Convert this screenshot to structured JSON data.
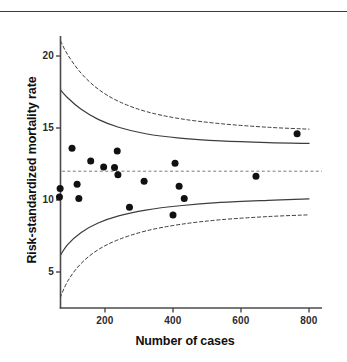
{
  "figure": {
    "top_rule": "horizontal-rule",
    "background_color": "#ffffff",
    "axis_color": "#4a4a4a",
    "point_color": "#111111",
    "line_color": "#3d3d3d"
  },
  "chart_data": {
    "type": "scatter",
    "title": "",
    "subtitle": "",
    "xlabel": "Number of cases",
    "ylabel": "Risk-standardized mortality rate",
    "xlim": [
      60,
      800
    ],
    "ylim": [
      2.8,
      21.5
    ],
    "xticks": [
      200,
      400,
      600,
      800
    ],
    "xtick_labels": [
      "200",
      "400",
      "600",
      "800"
    ],
    "yticks": [
      5,
      10,
      15,
      20
    ],
    "ytick_labels": [
      "5",
      "10",
      "15",
      "20"
    ],
    "grid": false,
    "legend": null,
    "legend_position": "none",
    "annotations": [],
    "target_line": {
      "label": "overall mean",
      "value": 12.0,
      "style": "dashed"
    },
    "series": [
      {
        "name": "Hospitals",
        "type": "scatter",
        "marker": "filled-circle",
        "points": [
          {
            "x": 68,
            "y": 10.8
          },
          {
            "x": 66,
            "y": 10.2
          },
          {
            "x": 103,
            "y": 13.6
          },
          {
            "x": 118,
            "y": 11.1
          },
          {
            "x": 123,
            "y": 10.1
          },
          {
            "x": 158,
            "y": 12.7
          },
          {
            "x": 196,
            "y": 12.3
          },
          {
            "x": 228,
            "y": 12.25
          },
          {
            "x": 236,
            "y": 13.4
          },
          {
            "x": 238,
            "y": 11.75
          },
          {
            "x": 272,
            "y": 9.5
          },
          {
            "x": 315,
            "y": 11.3
          },
          {
            "x": 400,
            "y": 8.95
          },
          {
            "x": 406,
            "y": 12.55
          },
          {
            "x": 418,
            "y": 10.95
          },
          {
            "x": 433,
            "y": 10.1
          },
          {
            "x": 644,
            "y": 11.65
          },
          {
            "x": 765,
            "y": 14.6
          }
        ]
      },
      {
        "name": "95% control limit (upper)",
        "type": "line",
        "style": "solid",
        "points": [
          {
            "x": 62,
            "y": 17.85
          },
          {
            "x": 90,
            "y": 17.1
          },
          {
            "x": 130,
            "y": 16.3
          },
          {
            "x": 180,
            "y": 15.6
          },
          {
            "x": 240,
            "y": 15.05
          },
          {
            "x": 320,
            "y": 14.6
          },
          {
            "x": 420,
            "y": 14.3
          },
          {
            "x": 540,
            "y": 14.1
          },
          {
            "x": 680,
            "y": 13.98
          },
          {
            "x": 800,
            "y": 13.93
          }
        ]
      },
      {
        "name": "95% control limit (lower)",
        "type": "line",
        "style": "solid",
        "points": [
          {
            "x": 62,
            "y": 5.9
          },
          {
            "x": 90,
            "y": 6.9
          },
          {
            "x": 130,
            "y": 7.75
          },
          {
            "x": 180,
            "y": 8.4
          },
          {
            "x": 240,
            "y": 8.9
          },
          {
            "x": 320,
            "y": 9.3
          },
          {
            "x": 420,
            "y": 9.6
          },
          {
            "x": 540,
            "y": 9.83
          },
          {
            "x": 680,
            "y": 9.98
          },
          {
            "x": 800,
            "y": 10.08
          }
        ]
      },
      {
        "name": "99.8% control limit (upper)",
        "type": "line",
        "style": "dashed",
        "points": [
          {
            "x": 62,
            "y": 21.4
          },
          {
            "x": 90,
            "y": 20.1
          },
          {
            "x": 130,
            "y": 18.8
          },
          {
            "x": 180,
            "y": 17.7
          },
          {
            "x": 240,
            "y": 16.85
          },
          {
            "x": 320,
            "y": 16.15
          },
          {
            "x": 420,
            "y": 15.65
          },
          {
            "x": 540,
            "y": 15.3
          },
          {
            "x": 680,
            "y": 15.05
          },
          {
            "x": 800,
            "y": 14.92
          }
        ]
      },
      {
        "name": "99.8% control limit (lower)",
        "type": "line",
        "style": "dashed",
        "points": [
          {
            "x": 62,
            "y": 2.85
          },
          {
            "x": 90,
            "y": 4.35
          },
          {
            "x": 130,
            "y": 5.6
          },
          {
            "x": 180,
            "y": 6.55
          },
          {
            "x": 240,
            "y": 7.25
          },
          {
            "x": 320,
            "y": 7.85
          },
          {
            "x": 420,
            "y": 8.3
          },
          {
            "x": 540,
            "y": 8.63
          },
          {
            "x": 680,
            "y": 8.85
          },
          {
            "x": 800,
            "y": 8.97
          }
        ]
      }
    ]
  }
}
